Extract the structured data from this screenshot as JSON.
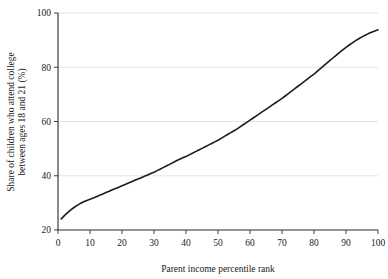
{
  "chart_data": {
    "type": "line",
    "title": "",
    "xlabel": "Parent income percentile rank",
    "ylabel": "Share of children who attend college between ages 18 and 21 (%)",
    "ylabel_line1": "Share of children who attend college",
    "ylabel_line2": "between ages 18 and 21 (%)",
    "xlim": [
      0,
      100
    ],
    "ylim": [
      20,
      100
    ],
    "xticks": [
      0,
      10,
      20,
      30,
      40,
      50,
      60,
      70,
      80,
      90,
      100
    ],
    "xticklabels": [
      "0",
      "10",
      "20",
      "30",
      "40",
      "50",
      "60",
      "70",
      "80",
      "90",
      "100"
    ],
    "yticks": [
      20,
      40,
      60,
      80,
      100
    ],
    "yticklabels": [
      "20",
      "40",
      "60",
      "80",
      "100"
    ],
    "grid": "horizontal",
    "legend": "none",
    "line_color": "#1c1c1c",
    "grid_color": "#d9d9d9",
    "axis_color": "#2b2b2b",
    "background_color": "#ffffff",
    "series": [
      {
        "name": "Share attending college",
        "x": [
          1,
          2,
          3,
          4,
          5,
          6,
          7,
          8,
          9,
          10,
          11,
          12,
          13,
          14,
          15,
          16,
          17,
          18,
          19,
          20,
          21,
          22,
          23,
          24,
          25,
          26,
          27,
          28,
          29,
          30,
          31,
          32,
          33,
          34,
          35,
          36,
          37,
          38,
          39,
          40,
          41,
          42,
          43,
          44,
          45,
          46,
          47,
          48,
          49,
          50,
          51,
          52,
          53,
          54,
          55,
          56,
          57,
          58,
          59,
          60,
          61,
          62,
          63,
          64,
          65,
          66,
          67,
          68,
          69,
          70,
          71,
          72,
          73,
          74,
          75,
          76,
          77,
          78,
          79,
          80,
          81,
          82,
          83,
          84,
          85,
          86,
          87,
          88,
          89,
          90,
          91,
          92,
          93,
          94,
          95,
          96,
          97,
          98,
          99,
          100
        ],
        "y": [
          24.1,
          25.3,
          26.4,
          27.4,
          28.3,
          29.1,
          29.8,
          30.4,
          30.9,
          31.3,
          31.8,
          32.3,
          32.8,
          33.3,
          33.8,
          34.3,
          34.8,
          35.3,
          35.8,
          36.3,
          36.8,
          37.3,
          37.8,
          38.3,
          38.8,
          39.3,
          39.8,
          40.3,
          40.8,
          41.3,
          41.9,
          42.5,
          43.1,
          43.7,
          44.3,
          44.9,
          45.5,
          46.1,
          46.6,
          47.1,
          47.7,
          48.3,
          48.9,
          49.5,
          50.1,
          50.7,
          51.3,
          51.9,
          52.5,
          53.1,
          53.8,
          54.5,
          55.2,
          55.9,
          56.6,
          57.3,
          58.1,
          58.9,
          59.7,
          60.5,
          61.3,
          62.1,
          62.9,
          63.7,
          64.5,
          65.3,
          66.1,
          66.9,
          67.7,
          68.5,
          69.4,
          70.3,
          71.2,
          72.1,
          73.0,
          73.9,
          74.8,
          75.7,
          76.6,
          77.5,
          78.5,
          79.5,
          80.5,
          81.5,
          82.5,
          83.5,
          84.5,
          85.5,
          86.4,
          87.3,
          88.2,
          89.0,
          89.8,
          90.5,
          91.2,
          91.8,
          92.4,
          92.9,
          93.4,
          93.8
        ]
      }
    ]
  }
}
